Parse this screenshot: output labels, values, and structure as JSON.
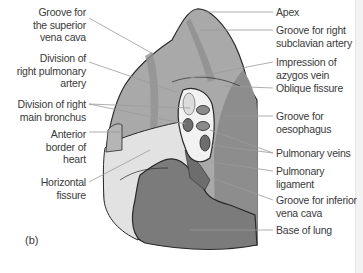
{
  "diagram": {
    "panel_label": "(b)",
    "colors": {
      "upper_lobe": "#a9a9a9",
      "upper_lobe_groove": "#8f8f8f",
      "middle_lobe": "#e2e2e2",
      "lower_lobe_posterior": "#8a8a8a",
      "base": "#7b7b7b",
      "hilum": "#f2f2f2",
      "outline": "#2a2a2a",
      "leader_line": "#9a9a9a",
      "text": "#3a3a3a"
    },
    "labels_left": [
      {
        "id": "svc",
        "text": "Groove for\nthe superior\nvena cava"
      },
      {
        "id": "rpa",
        "text": "Division of\nright pulmonary\nartery"
      },
      {
        "id": "rmb",
        "text": "Division of right\nmain bronchus"
      },
      {
        "id": "anterior",
        "text": "Anterior\nborder of\nheart"
      },
      {
        "id": "horizontal",
        "text": "Horizontal\nfissure"
      }
    ],
    "labels_right": [
      {
        "id": "apex",
        "text": "Apex"
      },
      {
        "id": "subclavian",
        "text": "Groove for right\nsubclavian artery"
      },
      {
        "id": "azygos",
        "text": "Impression of\nazygos vein"
      },
      {
        "id": "oblique",
        "text": "Oblique fissure"
      },
      {
        "id": "oesophagus",
        "text": "Groove for\noesophagus"
      },
      {
        "id": "pv",
        "text": "Pulmonary veins"
      },
      {
        "id": "ligament",
        "text": "Pulmonary\nligament"
      },
      {
        "id": "ivc",
        "text": "Groove for inferior\nvena cava"
      },
      {
        "id": "base",
        "text": "Base of lung"
      }
    ]
  }
}
